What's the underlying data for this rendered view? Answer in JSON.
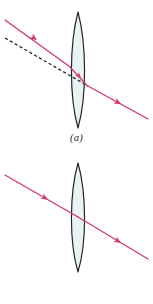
{
  "figure": {
    "background_color": "#ffffff"
  },
  "style": {
    "ray_color": "#d0386c",
    "construction_line_color": "#231f20",
    "lens_outline_color": "#231f20",
    "lens_fill_color": "#e8f3f5",
    "caption_color": "#231f20"
  },
  "panels": [
    {
      "id": "a",
      "caption": "(a)",
      "description": "Oblique ray refracted by a thin converging lens; dashed line shows the original undeviated direction",
      "lens": {
        "name": "converging-lens",
        "type": "biconvex",
        "axis_x": 78,
        "top_y": 12,
        "bottom_y": 128,
        "half_width": 9,
        "fill": "#e8f3f5",
        "stroke": "#231f20"
      },
      "rays": [
        {
          "name": "incident-ray",
          "label": "incident ray",
          "color": "#d0386c",
          "dashed": false,
          "from": [
            5,
            20
          ],
          "to": [
            69,
            66
          ],
          "arrow_at": 0.52,
          "arrow_direction": "down-right"
        },
        {
          "name": "internal-ray",
          "label": "ray inside lens",
          "color": "#d0386c",
          "dashed": false,
          "from": [
            69,
            66
          ],
          "to": [
            87,
            85
          ],
          "arrow_at": 0.55,
          "arrow_direction": "down-right"
        },
        {
          "name": "emergent-ray",
          "label": "emergent ray",
          "color": "#d0386c",
          "dashed": false,
          "from": [
            87,
            85
          ],
          "to": [
            148,
            119
          ],
          "arrow_at": 0.5,
          "arrow_direction": "down-right"
        },
        {
          "name": "construction-line",
          "label": "undeviated direction (dashed)",
          "color": "#231f20",
          "dashed": true,
          "from": [
            5,
            38
          ],
          "to": [
            88,
            86
          ],
          "arrow_at": null,
          "arrow_direction": "none"
        }
      ]
    },
    {
      "id": "b",
      "caption": "(b)",
      "description": "Ray through the centre of a thin lens emerges undeviated",
      "lens": {
        "name": "converging-lens",
        "type": "biconvex",
        "axis_x": 78,
        "top_y": 163,
        "bottom_y": 272,
        "half_width": 9,
        "fill": "#e8f3f5",
        "stroke": "#231f20"
      },
      "rays": [
        {
          "name": "incident-ray",
          "label": "incident ray",
          "color": "#d0386c",
          "dashed": false,
          "from": [
            5,
            175
          ],
          "to": [
            78,
            217
          ],
          "arrow_at": 0.55,
          "arrow_direction": "down-right"
        },
        {
          "name": "emergent-ray",
          "label": "emergent ray",
          "color": "#d0386c",
          "dashed": false,
          "from": [
            78,
            217
          ],
          "to": [
            148,
            259
          ],
          "arrow_at": 0.55,
          "arrow_direction": "down-right"
        }
      ]
    }
  ]
}
